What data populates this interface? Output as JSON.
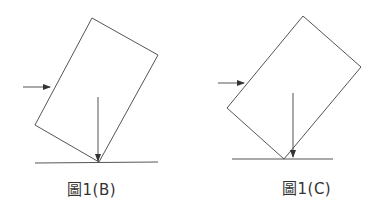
{
  "figures": [
    {
      "id": "B",
      "caption": "圖1(B)",
      "rect": [
        [
          92,
          18
        ],
        [
          158,
          55
        ],
        [
          99,
          162
        ],
        [
          35,
          125
        ]
      ],
      "push_arrow": {
        "x1": 23,
        "y1": 87,
        "x2": 50,
        "y2": 87
      },
      "weight_arrow": {
        "x1": 98,
        "y1": 97,
        "x2": 98,
        "y2": 161
      },
      "ground": {
        "x1": 35,
        "y1": 163,
        "x2": 158,
        "y2": 162
      },
      "caption_pos": {
        "left": 67,
        "top": 178
      }
    },
    {
      "id": "C",
      "caption": "圖1(C)",
      "rect": [
        [
          303,
          16
        ],
        [
          361,
          67
        ],
        [
          284,
          159
        ],
        [
          227,
          108
        ]
      ],
      "push_arrow": {
        "x1": 218,
        "y1": 83,
        "x2": 244,
        "y2": 83
      },
      "weight_arrow": {
        "x1": 293,
        "y1": 93,
        "x2": 293,
        "y2": 157
      },
      "ground": {
        "x1": 232,
        "y1": 159,
        "x2": 333,
        "y2": 159
      },
      "caption_pos": {
        "left": 282,
        "top": 177
      }
    }
  ],
  "colors": {
    "stroke": "#555555",
    "text": "#333333"
  }
}
